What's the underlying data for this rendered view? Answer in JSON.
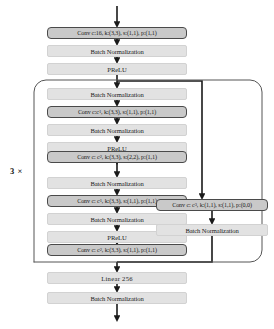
{
  "diagram": {
    "repeat_label": "3 ×",
    "colors": {
      "conv_fill": "#c9c9c9",
      "conv_border": "#4a4a4a",
      "plain_fill": "#e2e2e2",
      "plain_border": "#d2d2d2",
      "wire": "#1a1a1a",
      "envelope": "#555555",
      "background": "#ffffff"
    },
    "nodes": [
      {
        "id": "stem-conv",
        "kind": "conv",
        "text": "Conv c:16, k:(3,3), s:(1,1), p:(1,1)",
        "x": 47,
        "y": 27,
        "w": 140,
        "h": 12
      },
      {
        "id": "stem-bn",
        "kind": "plain",
        "text": "Batch Normalization",
        "x": 47,
        "y": 45,
        "w": 140,
        "h": 12
      },
      {
        "id": "stem-prelu",
        "kind": "plain",
        "text": "PReLU",
        "x": 47,
        "y": 63,
        "w": 140,
        "h": 12
      },
      {
        "id": "block-bn-1",
        "kind": "plain",
        "text": "Batch Normalization",
        "x": 47,
        "y": 88,
        "w": 140,
        "h": 12
      },
      {
        "id": "block-conv-1",
        "kind": "conv",
        "text_html": "Conv c:c<sub>1</sub>, k:(3,3), s:(1,1), p:(1,1)",
        "text": "Conv c:c1, k:(3,3), s:(1,1), p:(1,1)",
        "x": 47,
        "y": 106,
        "w": 140,
        "h": 12
      },
      {
        "id": "block-bn-2",
        "kind": "plain",
        "text": "Batch Normalization",
        "x": 47,
        "y": 124,
        "w": 140,
        "h": 12
      },
      {
        "id": "block-prelu-1",
        "kind": "plain",
        "text": "PReLU",
        "x": 47,
        "y": 142,
        "w": 140,
        "h": 12
      },
      {
        "id": "block-conv-2",
        "kind": "conv",
        "text_html": "Conv c: c<sub>2</sub>, k:(3,3), s:(2,2), p:(1,1)",
        "text": "Conv c: c2, k:(3,3), s:(2,2), p:(1,1)",
        "x": 47,
        "y": 151,
        "w": 140,
        "h": 12
      },
      {
        "id": "block-bn-3",
        "kind": "plain",
        "text": "Batch Normalization",
        "x": 47,
        "y": 177,
        "w": 140,
        "h": 12
      },
      {
        "id": "block-conv-3",
        "kind": "conv",
        "text_html": "Conv c: c<sub>1</sub>, k:(3,3), s:(1,1), p:(1,1)",
        "text": "Conv c: c1, k:(3,3), s:(1,1), p:(1,1)",
        "x": 47,
        "y": 195,
        "w": 140,
        "h": 12
      },
      {
        "id": "block-bn-4",
        "kind": "plain",
        "text": "Batch Normalization",
        "x": 47,
        "y": 213,
        "w": 140,
        "h": 12
      },
      {
        "id": "block-prelu-2",
        "kind": "plain",
        "text": "PReLU",
        "x": 47,
        "y": 231,
        "w": 140,
        "h": 12
      },
      {
        "id": "block-conv-4",
        "kind": "conv",
        "text_html": "Conv c: c<sub>2</sub>, k:(3,3), s:(1,1), p:(1,1)",
        "text": "Conv c: c2, k:(3,3), s:(1,1), p:(1,1)",
        "x": 47,
        "y": 244,
        "w": 140,
        "h": 12
      },
      {
        "id": "shortcut-conv",
        "kind": "conv",
        "text_html": "Conv c: c<sub>3</sub>, k:(1,1), s:(1,1), p:(0,0)",
        "text": "Conv c: c3, k:(1,1), s:(1,1), p:(0,0)",
        "x": 156,
        "y": 199,
        "w": 112,
        "h": 12
      },
      {
        "id": "shortcut-bn",
        "kind": "plain",
        "text": "Batch Normalization",
        "x": 156,
        "y": 224,
        "w": 112,
        "h": 12
      },
      {
        "id": "head-linear",
        "kind": "plain",
        "text": "Linear  256",
        "x": 47,
        "y": 272,
        "w": 140,
        "h": 12
      },
      {
        "id": "head-bn",
        "kind": "plain",
        "text": "Batch Normalization",
        "x": 47,
        "y": 292,
        "w": 140,
        "h": 12
      }
    ]
  }
}
